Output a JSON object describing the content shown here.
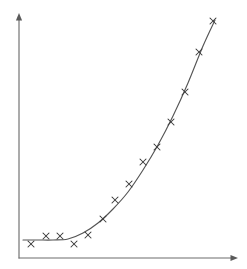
{
  "figure": {
    "background_color": "#ffffff",
    "width": 247,
    "height": 269,
    "title": "",
    "marker_glyph": "x"
  },
  "style": {
    "axis_color": "#6d6d6d",
    "curve_color": "#555555",
    "marker_color": "#3a3a3a"
  },
  "axes": {
    "x_axis": {
      "label": "",
      "origin_x": 19,
      "origin_y": 258,
      "end_x": 238,
      "end_y": 258,
      "has_arrow": true,
      "ticks": [],
      "tick_labels": []
    },
    "y_axis": {
      "label": "",
      "origin_x": 19,
      "origin_y": 258,
      "end_x": 19,
      "end_y": 13,
      "has_arrow": true,
      "ticks": [],
      "tick_labels": []
    }
  },
  "chart_data": {
    "type": "scatter",
    "title": "",
    "subtitle": "",
    "xlabel": "",
    "ylabel": "",
    "grid": false,
    "legend": null,
    "legend_position": "none",
    "annotations": [],
    "xlim": [
      0,
      14.6
    ],
    "ylim": [
      0,
      16.3
    ],
    "x_tick_labels": [],
    "y_tick_labels": [],
    "series": [
      {
        "name": "observations",
        "type": "scatter",
        "marker": "x",
        "color": "#3a3a3a",
        "x": [
          0.8,
          1.8,
          2.7,
          3.7,
          4.6,
          5.6,
          6.4,
          7.3,
          8.3,
          9.2,
          10.1,
          11.1,
          12.0,
          12.9
        ],
        "y": [
          0.9,
          1.5,
          1.5,
          0.9,
          1.5,
          2.6,
          3.9,
          4.9,
          6.4,
          7.4,
          9.1,
          11.1,
          13.7,
          15.8
        ],
        "points_px": [
          [
            31,
            244
          ],
          [
            46,
            236
          ],
          [
            60,
            236
          ],
          [
            74,
            244
          ],
          [
            88,
            235
          ],
          [
            103,
            219
          ],
          [
            115,
            200
          ],
          [
            129,
            184
          ],
          [
            143,
            162
          ],
          [
            157,
            147
          ],
          [
            171,
            122
          ],
          [
            185,
            92
          ],
          [
            199,
            52
          ],
          [
            213,
            21
          ]
        ]
      },
      {
        "name": "fitted-curve",
        "type": "line",
        "color": "#555555",
        "x": [
          0.3,
          1.3,
          2.3,
          3.3,
          4.3,
          5.3,
          6.3,
          7.3,
          8.3,
          9.3,
          10.3,
          11.3,
          12.3,
          13.1
        ],
        "y": [
          1.2,
          1.2,
          1.2,
          1.3,
          1.7,
          2.4,
          3.3,
          4.5,
          6.0,
          7.7,
          9.7,
          11.9,
          14.4,
          16.0
        ],
        "points_px": [
          [
            23,
            240
          ],
          [
            38,
            240
          ],
          [
            53,
            240
          ],
          [
            68,
            239
          ],
          [
            83,
            233
          ],
          [
            98,
            223
          ],
          [
            113,
            209
          ],
          [
            128,
            192
          ],
          [
            143,
            170
          ],
          [
            158,
            145
          ],
          [
            173,
            116
          ],
          [
            188,
            83
          ],
          [
            203,
            46
          ],
          [
            215,
            20
          ]
        ]
      }
    ]
  }
}
